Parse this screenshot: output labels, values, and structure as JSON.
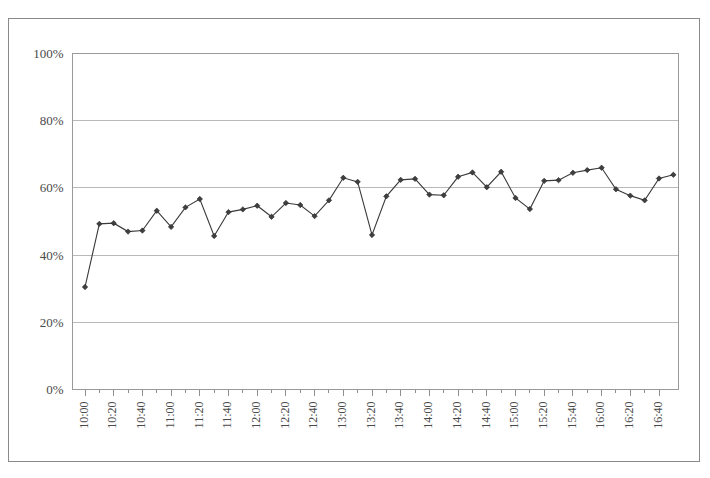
{
  "chart_data": {
    "type": "line",
    "title": "",
    "subtitle": "",
    "xlabel": "",
    "ylabel": "",
    "ylim": [
      0,
      100
    ],
    "y_tick_labels": [
      "0%",
      "20%",
      "40%",
      "60%",
      "80%",
      "100%"
    ],
    "y_tick_values": [
      0,
      20,
      40,
      60,
      80,
      100
    ],
    "grid": true,
    "grid_axis": "y",
    "legend": false,
    "legend_position": "none",
    "x_tick_labels": [
      "10:00",
      "10:20",
      "10:40",
      "11:00",
      "11:20",
      "11:40",
      "12:00",
      "12:20",
      "12:40",
      "13:00",
      "13:20",
      "13:40",
      "14:00",
      "14:20",
      "14:40",
      "15:00",
      "15:20",
      "15:40",
      "16:00",
      "16:20",
      "16:40"
    ],
    "x_tick_label_rotation": 90,
    "x_minor_ticks_between_labels": 1,
    "x": [
      "10:00",
      "10:10",
      "10:20",
      "10:30",
      "10:40",
      "10:50",
      "11:00",
      "11:10",
      "11:20",
      "11:30",
      "11:40",
      "11:50",
      "12:00",
      "12:10",
      "12:20",
      "12:30",
      "12:40",
      "12:50",
      "13:00",
      "13:10",
      "13:20",
      "13:30",
      "13:40",
      "13:50",
      "14:00",
      "14:10",
      "14:20",
      "14:30",
      "14:40",
      "14:50",
      "15:00",
      "15:10",
      "15:20",
      "15:30",
      "15:40",
      "15:50",
      "16:00",
      "16:10",
      "16:20",
      "16:30",
      "16:40",
      "16:50"
    ],
    "values": [
      30.5,
      49.3,
      49.5,
      47.0,
      47.3,
      53.2,
      48.4,
      54.2,
      56.7,
      45.7,
      52.8,
      53.6,
      54.7,
      51.4,
      55.5,
      54.9,
      51.6,
      56.3,
      63.0,
      61.8,
      46.0,
      57.5,
      62.4,
      62.7,
      58.0,
      57.8,
      63.3,
      64.6,
      60.2,
      64.8,
      57.0,
      53.7,
      62.1,
      62.3,
      64.5,
      65.3,
      66.0,
      59.6,
      57.7,
      56.3,
      62.8,
      63.9
    ],
    "series": [
      {
        "name": "series-1",
        "color": "#3a3a3a",
        "marker": "diamond",
        "values": [
          30.5,
          49.3,
          49.5,
          47.0,
          47.3,
          53.2,
          48.4,
          54.2,
          56.7,
          45.7,
          52.8,
          53.6,
          54.7,
          51.4,
          55.5,
          54.9,
          51.6,
          56.3,
          63.0,
          61.8,
          46.0,
          57.5,
          62.4,
          62.7,
          58.0,
          57.8,
          63.3,
          64.6,
          60.2,
          64.8,
          57.0,
          53.7,
          62.1,
          62.3,
          64.5,
          65.3,
          66.0,
          59.6,
          57.7,
          56.3,
          62.8,
          63.9
        ]
      }
    ]
  },
  "colors": {
    "line": "#3a3a3a",
    "marker_fill": "#3f3f3f",
    "grid": "#b9b9b9",
    "plot_border": "#9a9a9a",
    "figure_border": "#8a8a8a",
    "tick_text": "#4a4a4a",
    "background": "#ffffff"
  }
}
